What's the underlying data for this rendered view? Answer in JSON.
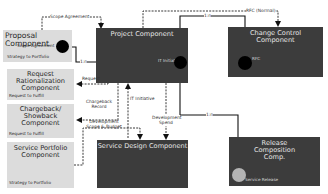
{
  "diagram": {
    "components": {
      "proposal": {
        "title": "Proposal Component",
        "port": "Scope Agreement",
        "stream": "Strategy to Portfolio"
      },
      "project": {
        "title": "Project Component",
        "port": "IT Initiative"
      },
      "change_control": {
        "title": "Change Control Component",
        "port": "RFC"
      },
      "request_rationalization": {
        "title": "Request Rationalization Component",
        "stream": "Request to Fulfill"
      },
      "chargeback": {
        "title": "Chargeback/ Showback Component",
        "stream": "Request to Fulfill"
      },
      "service_portfolio": {
        "title": "Service Portfolio Component",
        "stream": "Strategy to Portfolio"
      },
      "service_design": {
        "title": "Service Design Component"
      },
      "release_composition": {
        "title": "Release Composition Comp.",
        "port": "Service Release"
      }
    },
    "flows": {
      "scope_agreement": "Scope Agreement",
      "rfc_normal": "RFC (Normal)",
      "one_to_n_a": "1:n",
      "one_to_n_b": "1:n",
      "one_to_n_c": "1:n",
      "request": "Request",
      "chargeback_record": "Chargeback Record",
      "it_initiative": "IT Initiative",
      "development_scope_budget": "Development Scope & Budget",
      "development_spend": "Development Spend"
    },
    "colors": {
      "light_box": "#dcdcdc",
      "dark_box": "#3c3c3c",
      "port_dark": "#000000",
      "port_light": "#b4b4b4"
    }
  }
}
